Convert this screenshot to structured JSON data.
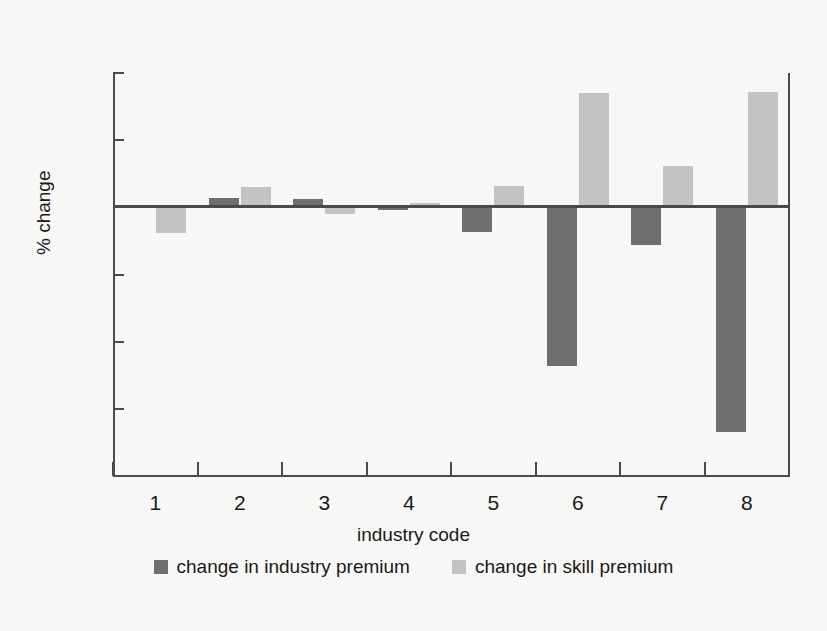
{
  "chart_data": {
    "type": "bar",
    "title": "",
    "xlabel": "industry code",
    "ylabel": "% change",
    "categories": [
      "1",
      "2",
      "3",
      "4",
      "5",
      "6",
      "7",
      "8"
    ],
    "ylim": [
      -20,
      10
    ],
    "yticks": [
      10,
      5,
      0,
      -5,
      -10,
      -15,
      -20
    ],
    "ytick_labels": [
      "10",
      "5",
      "0",
      "−5",
      "−10",
      "−15",
      "−20"
    ],
    "grid": false,
    "legend_position": "bottom",
    "series": [
      {
        "name": "change in industry premium",
        "color": "#6f6f6f",
        "values": [
          0.0,
          0.7,
          0.6,
          -0.2,
          -1.8,
          -11.8,
          -2.8,
          -16.7
        ]
      },
      {
        "name": "change in skill premium",
        "color": "#c3c3c3",
        "values": [
          -1.9,
          1.55,
          -0.5,
          0.3,
          1.6,
          8.5,
          3.1,
          8.6
        ]
      }
    ]
  },
  "legend": {
    "items": [
      {
        "label": "change in industry premium",
        "color": "#6f6f6f"
      },
      {
        "label": "change in skill premium",
        "color": "#c3c3c3"
      }
    ]
  }
}
